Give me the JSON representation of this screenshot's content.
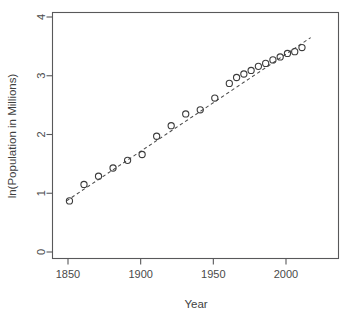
{
  "chart_data": {
    "type": "scatter",
    "title": "",
    "xlabel": "Year",
    "ylabel": "ln(Population in Millions)",
    "xlim": [
      1840,
      2025
    ],
    "ylim": [
      -0.15,
      4.15
    ],
    "grid": false,
    "legend": null,
    "x_ticks": [
      1850,
      1900,
      1950,
      2000
    ],
    "y_ticks": [
      0,
      1,
      2,
      3,
      4
    ],
    "x_tick_labels": [
      "1850",
      "1900",
      "1950",
      "2000"
    ],
    "y_tick_labels": [
      "0",
      "1",
      "2",
      "3",
      "4"
    ],
    "marker_style": "open-circle",
    "series": [
      {
        "name": "ln(Population in Millions)",
        "x": [
          1851,
          1861,
          1871,
          1881,
          1891,
          1901,
          1911,
          1921,
          1931,
          1941,
          1951,
          1961,
          1966,
          1971,
          1976,
          1981,
          1986,
          1991,
          1996,
          2001,
          2006,
          2011
        ],
        "y": [
          0.87,
          1.15,
          1.29,
          1.43,
          1.56,
          1.66,
          1.97,
          2.15,
          2.35,
          2.42,
          2.62,
          2.87,
          2.97,
          3.03,
          3.09,
          3.16,
          3.21,
          3.27,
          3.32,
          3.38,
          3.41,
          3.48
        ]
      }
    ],
    "fit_line": {
      "name": "linear-fit",
      "style": "dashed",
      "x": [
        1849,
        2017
      ],
      "y": [
        0.87,
        3.65
      ]
    }
  },
  "axis": {
    "x_title": "Year",
    "y_title": "ln(Population in Millions)"
  },
  "colors": {
    "axis": "#58585a",
    "marker": "#3c3c3c",
    "fit": "#4c4c4c",
    "background": "#ffffff"
  }
}
